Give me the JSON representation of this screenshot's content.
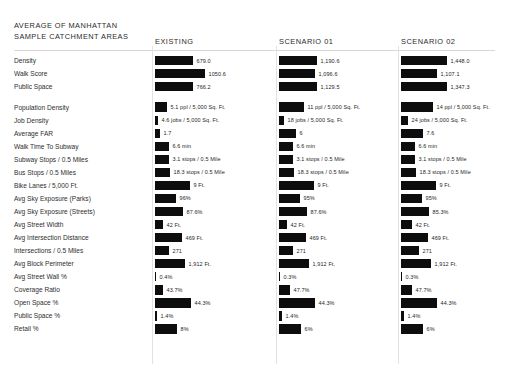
{
  "title": {
    "line1": "AVERAGE OF MANHATTAN",
    "line2": "SAMPLE CATCHMENT AREAS"
  },
  "columns": [
    {
      "key": "existing",
      "label": "EXISTING"
    },
    {
      "key": "scenario01",
      "label": "SCENARIO 01"
    },
    {
      "key": "scenario02",
      "label": "SCENARIO 02"
    }
  ],
  "accent_color": "#0d0d0d",
  "rule_color": "#d8d8d8",
  "chart_data": {
    "type": "bar",
    "title": "AVERAGE OF MANHATTAN SAMPLE CATCHMENT AREAS",
    "orientation": "horizontal",
    "grid": false,
    "legend": "none",
    "series": [
      {
        "name": "EXISTING"
      },
      {
        "name": "SCENARIO 01"
      },
      {
        "name": "SCENARIO 02"
      }
    ],
    "groups": [
      {
        "name": "composite-scores",
        "rows": [
          {
            "category": "Density",
            "existing": {
              "value": 679.0,
              "text": "679.0",
              "bar": 38
            },
            "scenario01": {
              "value": 1190.6,
              "text": "1,190.6",
              "bar": 38
            },
            "scenario02": {
              "value": 1448.0,
              "text": "1,448.0",
              "bar": 46
            }
          },
          {
            "category": "Walk Score",
            "existing": {
              "value": 1050.6,
              "text": "1050.6",
              "bar": 50
            },
            "scenario01": {
              "value": 1096.6,
              "text": "1,096.6",
              "bar": 36
            },
            "scenario02": {
              "value": 1107.1,
              "text": "1,107.1",
              "bar": 36
            }
          },
          {
            "category": "Public Space",
            "existing": {
              "value": 766.2,
              "text": "766.2",
              "bar": 38
            },
            "scenario01": {
              "value": 1129.5,
              "text": "1,129.5",
              "bar": 38
            },
            "scenario02": {
              "value": 1347.3,
              "text": "1,347.3",
              "bar": 46
            }
          }
        ]
      },
      {
        "name": "metrics",
        "rows": [
          {
            "category": "Population Density",
            "existing": {
              "text": "5.1 ppl / 5,000 Sq. Ft.",
              "bar": 12
            },
            "scenario01": {
              "text": "11 ppl / 5,000 Sq. Ft.",
              "bar": 25
            },
            "scenario02": {
              "text": "14 ppl / 5,000 Sq. Ft.",
              "bar": 32
            }
          },
          {
            "category": "Job Density",
            "existing": {
              "text": "4.6 jobs / 5,000 Sq. Ft.",
              "bar": 3
            },
            "scenario01": {
              "text": "18 jobs / 5,000 Sq. Ft.",
              "bar": 5
            },
            "scenario02": {
              "text": "24 jobs / 5,000 Sq. Ft.",
              "bar": 7
            }
          },
          {
            "category": "Average FAR",
            "existing": {
              "text": "1.7",
              "bar": 5
            },
            "scenario01": {
              "text": "6",
              "bar": 17
            },
            "scenario02": {
              "text": "7.6",
              "bar": 22
            }
          },
          {
            "category": "Walk Time To Subway",
            "existing": {
              "text": "6.6 min",
              "bar": 14
            },
            "scenario01": {
              "text": "6.6 min",
              "bar": 14
            },
            "scenario02": {
              "text": "6.6 min",
              "bar": 14
            }
          },
          {
            "category": "Subway Stops / 0.5 Miles",
            "existing": {
              "text": "3.1 stops / 0.5 Mile",
              "bar": 14
            },
            "scenario01": {
              "text": "3.1 stops / 0.5 Mile",
              "bar": 14
            },
            "scenario02": {
              "text": "3.1 stops / 0.5 Mile",
              "bar": 14
            }
          },
          {
            "category": "Bus Stops / 0.5 Miles",
            "existing": {
              "text": "18.3 stops / 0.5 Mile",
              "bar": 15
            },
            "scenario01": {
              "text": "18.3 stops / 0.5 Mile",
              "bar": 15
            },
            "scenario02": {
              "text": "18.3 stops / 0.5 Mile",
              "bar": 15
            }
          },
          {
            "category": "Bike Lanes / 5,000 Ft.",
            "existing": {
              "text": "9 Ft.",
              "bar": 35
            },
            "scenario01": {
              "text": "9 Ft.",
              "bar": 35
            },
            "scenario02": {
              "text": "9 Ft.",
              "bar": 35
            }
          },
          {
            "category": "Avg Sky Exposure (Parks)",
            "existing": {
              "text": "96%",
              "bar": 21
            },
            "scenario01": {
              "text": "95%",
              "bar": 21
            },
            "scenario02": {
              "text": "95%",
              "bar": 21
            }
          },
          {
            "category": "Avg Sky Exposure (Streets)",
            "existing": {
              "text": "87.6%",
              "bar": 28
            },
            "scenario01": {
              "text": "87.6%",
              "bar": 28
            },
            "scenario02": {
              "text": "85.3%",
              "bar": 28
            }
          },
          {
            "category": "Avg Street Width",
            "existing": {
              "text": "42 Ft.",
              "bar": 8
            },
            "scenario01": {
              "text": "42 Ft.",
              "bar": 8
            },
            "scenario02": {
              "text": "42 Ft.",
              "bar": 11
            }
          },
          {
            "category": "Avg Intersection Distance",
            "existing": {
              "text": "469 Ft.",
              "bar": 27
            },
            "scenario01": {
              "text": "469 Ft.",
              "bar": 27
            },
            "scenario02": {
              "text": "469 Ft.",
              "bar": 27
            }
          },
          {
            "category": "Intersections / 0.5 Miles",
            "existing": {
              "text": "271",
              "bar": 14
            },
            "scenario01": {
              "text": "271",
              "bar": 14
            },
            "scenario02": {
              "text": "271",
              "bar": 18
            }
          },
          {
            "category": "Avg Block Perimeter",
            "existing": {
              "text": "1,912 Ft.",
              "bar": 30
            },
            "scenario01": {
              "text": "1,912 Ft.",
              "bar": 30
            },
            "scenario02": {
              "text": "1,912 Ft.",
              "bar": 30
            }
          },
          {
            "category": "Avg Street Wall %",
            "existing": {
              "text": "0.4%",
              "bar": 1
            },
            "scenario01": {
              "text": "0.3%",
              "bar": 1
            },
            "scenario02": {
              "text": "0.3%",
              "bar": 1
            }
          },
          {
            "category": "Coverage Ratio",
            "existing": {
              "text": "43.7%",
              "bar": 8
            },
            "scenario01": {
              "text": "47.7%",
              "bar": 11
            },
            "scenario02": {
              "text": "47.7%",
              "bar": 11
            }
          },
          {
            "category": "Open Space %",
            "existing": {
              "text": "44.3%",
              "bar": 36
            },
            "scenario01": {
              "text": "44.3%",
              "bar": 36
            },
            "scenario02": {
              "text": "44.3%",
              "bar": 36
            }
          },
          {
            "category": "Public Space %",
            "existing": {
              "text": "1.4%",
              "bar": 2
            },
            "scenario01": {
              "text": "1.4%",
              "bar": 3
            },
            "scenario02": {
              "text": "1.4%",
              "bar": 3
            }
          },
          {
            "category": "Retail %",
            "existing": {
              "text": "8%",
              "bar": 22
            },
            "scenario01": {
              "text": "6%",
              "bar": 22
            },
            "scenario02": {
              "text": "6%",
              "bar": 22
            }
          }
        ]
      }
    ]
  }
}
